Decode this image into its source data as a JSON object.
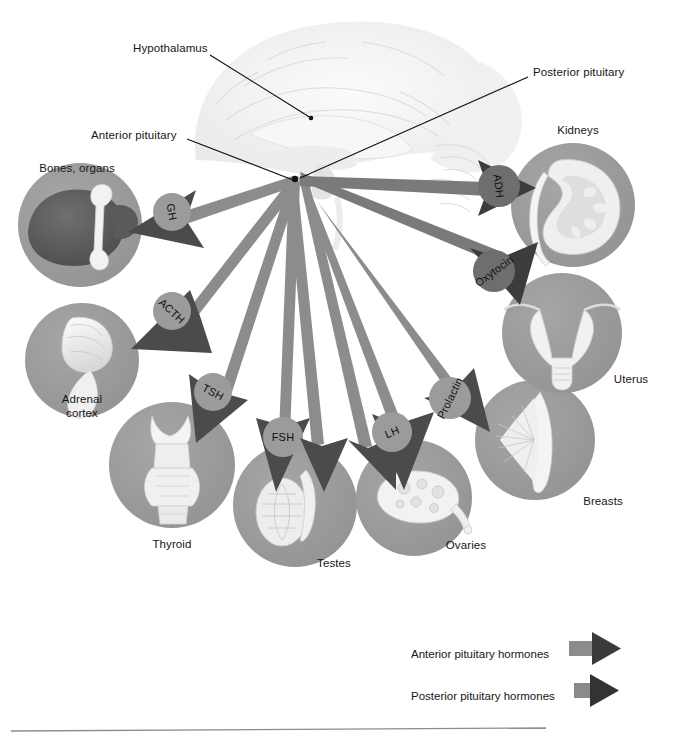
{
  "figure": {
    "title_hidden": "Pituitary gland hormones and their target organs",
    "background_color": "#ffffff",
    "rule_color": "#8d8d8d"
  },
  "colors": {
    "organ_circle": "#9a9a9a",
    "anterior_arrow": "#8c8c8c",
    "anterior_arrow_head": "#4b4b4b",
    "posterior_arrow": "#7a7a7a",
    "posterior_arrow_head": "#3c3c3c",
    "hormone_badge_anterior": "#9b9b9b",
    "hormone_badge_posterior": "#6e6e6e",
    "leader_line": "#111111",
    "brain": "#efefef",
    "text": "#161616"
  },
  "anatomy_callouts": [
    {
      "id": "hypothalamus",
      "label": "Hypothalamus",
      "x": 133,
      "y": 48,
      "anchor": "start"
    },
    {
      "id": "posterior-pituitary",
      "label": "Posterior pituitary",
      "x": 533,
      "y": 72,
      "anchor": "start"
    },
    {
      "id": "anterior-pituitary",
      "label": "Anterior pituitary",
      "x": 91,
      "y": 135,
      "anchor": "start"
    }
  ],
  "target_organs": [
    {
      "id": "bones-organs",
      "label": "Bones, organs",
      "cx": 80,
      "cy": 225,
      "r": 62,
      "label_x": 77,
      "label_y": 168
    },
    {
      "id": "adrenal-cortex",
      "label": "Adrenal\ncortex",
      "cx": 82,
      "cy": 360,
      "r": 57,
      "label_x": 82,
      "label_y": 406
    },
    {
      "id": "thyroid",
      "label": "Thyroid",
      "cx": 172,
      "cy": 465,
      "r": 63,
      "label_x": 172,
      "label_y": 545
    },
    {
      "id": "testes",
      "label": "Testes",
      "cx": 295,
      "cy": 505,
      "r": 62,
      "label_x": 334,
      "label_y": 563
    },
    {
      "id": "ovaries",
      "label": "Ovaries",
      "cx": 414,
      "cy": 498,
      "r": 58,
      "label_x": 466,
      "label_y": 545
    },
    {
      "id": "breasts",
      "label": "Breasts",
      "cx": 535,
      "cy": 440,
      "r": 60,
      "label_x": 603,
      "label_y": 501
    },
    {
      "id": "uterus",
      "label": "Uterus",
      "cx": 562,
      "cy": 333,
      "r": 60,
      "label_x": 631,
      "label_y": 379
    },
    {
      "id": "kidneys",
      "label": "Kidneys",
      "cx": 573,
      "cy": 205,
      "r": 62,
      "label_x": 577,
      "label_y": 130
    }
  ],
  "hormones": [
    {
      "id": "gh",
      "label": "GH",
      "type": "anterior",
      "badge_x": 172,
      "badge_y": 212,
      "badge_r": 19,
      "rotate": 80,
      "tip_x": 128,
      "tip_y": 232
    },
    {
      "id": "acth",
      "label": "ACTH",
      "type": "anterior",
      "badge_x": 172,
      "badge_y": 311,
      "badge_r": 19,
      "rotate": 43,
      "tip_x": 131,
      "tip_y": 349
    },
    {
      "id": "tsh",
      "label": "TSH",
      "type": "anterior",
      "badge_x": 213,
      "badge_y": 392,
      "badge_r": 19,
      "rotate": 28,
      "tip_x": 196,
      "tip_y": 443
    },
    {
      "id": "fsh",
      "label": "FSH",
      "type": "anterior",
      "badge_x": 283,
      "badge_y": 437,
      "badge_r": 20,
      "rotate": 0,
      "tip_x": 276,
      "tip_y": 492
    },
    {
      "id": "lh",
      "label": "LH",
      "type": "anterior",
      "badge_x": 392,
      "badge_y": 432,
      "badge_r": 20,
      "rotate": -22,
      "tip_x": 404,
      "tip_y": 490
    },
    {
      "id": "prolactin",
      "label": "Prolactin",
      "type": "anterior",
      "badge_x": 450,
      "badge_y": 398,
      "badge_r": 21,
      "rotate": -64,
      "tip_x": 490,
      "tip_y": 432
    },
    {
      "id": "oxytocin",
      "label": "Oxytocin",
      "type": "posterior",
      "badge_x": 494,
      "badge_y": 271,
      "badge_r": 21,
      "rotate": -36,
      "tip_x": 520,
      "tip_y": 305
    },
    {
      "id": "adh",
      "label": "ADH",
      "type": "posterior",
      "badge_x": 499,
      "badge_y": 186,
      "badge_r": 21,
      "rotate": 83,
      "tip_x": 536,
      "tip_y": 188
    }
  ],
  "legend": {
    "items": [
      {
        "id": "anterior",
        "label": "Anterior pituitary hormones",
        "x": 411,
        "y": 655,
        "arrow_x": 569,
        "arrow_y": 648,
        "style": "long"
      },
      {
        "id": "posterior",
        "label": "Posterior pituitary hormones",
        "x": 411,
        "y": 697,
        "arrow_x": 574,
        "arrow_y": 690,
        "style": "short"
      }
    ]
  }
}
